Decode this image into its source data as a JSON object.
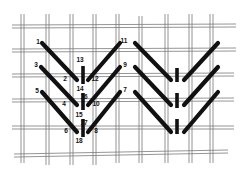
{
  "diagram": {
    "type": "embroidery-stitch-diagram",
    "colors": {
      "background": "#ffffff",
      "grid": "#7a7a7a",
      "stitch": "#111111",
      "label": "#111111"
    },
    "labels": [
      {
        "id": "1",
        "text": "1",
        "x": 38,
        "y": 44
      },
      {
        "id": "2",
        "text": "2",
        "x": 65,
        "y": 81
      },
      {
        "id": "3",
        "text": "3",
        "x": 36,
        "y": 67
      },
      {
        "id": "4",
        "text": "4",
        "x": 64,
        "y": 106
      },
      {
        "id": "5",
        "text": "5",
        "x": 37,
        "y": 93
      },
      {
        "id": "6",
        "text": "6",
        "x": 66,
        "y": 133
      },
      {
        "id": "7",
        "text": "7",
        "x": 125,
        "y": 92
      },
      {
        "id": "8",
        "text": "8",
        "x": 96,
        "y": 133
      },
      {
        "id": "9",
        "text": "9",
        "x": 125,
        "y": 67
      },
      {
        "id": "10",
        "text": "10",
        "x": 96,
        "y": 106
      },
      {
        "id": "11",
        "text": "11",
        "x": 124,
        "y": 43
      },
      {
        "id": "12",
        "text": "12",
        "x": 95,
        "y": 81
      },
      {
        "id": "13",
        "text": "13",
        "x": 80,
        "y": 62
      },
      {
        "id": "14",
        "text": "14",
        "x": 80,
        "y": 91
      },
      {
        "id": "15",
        "text": "15",
        "x": 79,
        "y": 117
      },
      {
        "id": "16",
        "text": "16",
        "x": 84,
        "y": 99
      },
      {
        "id": "17",
        "text": "17",
        "x": 84,
        "y": 125
      },
      {
        "id": "18",
        "text": "18",
        "x": 79,
        "y": 143
      }
    ]
  }
}
